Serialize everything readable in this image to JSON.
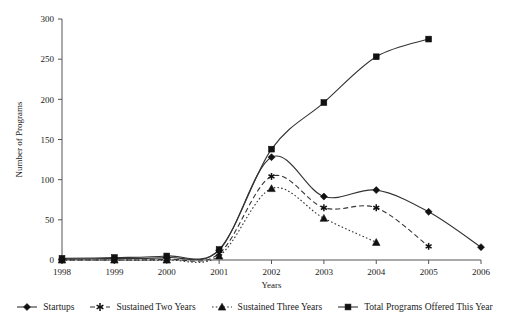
{
  "chart_data": {
    "type": "line",
    "title": "",
    "xlabel": "Years",
    "ylabel": "Number of Programs",
    "grid": false,
    "legend_position": "bottom",
    "x": [
      1998,
      1999,
      2000,
      2001,
      2002,
      2003,
      2004,
      2005,
      2006
    ],
    "categories": [
      "1998",
      "1999",
      "2000",
      "2001",
      "2002",
      "2003",
      "2004",
      "2005",
      "2006"
    ],
    "xlim": [
      1998,
      2006
    ],
    "ylim": [
      0,
      300
    ],
    "yticks": [
      0,
      50,
      100,
      150,
      200,
      250,
      300
    ],
    "ytick_labels": [
      "0",
      "50",
      "100",
      "150",
      "200",
      "250",
      "300"
    ],
    "xticks": [
      1998,
      1999,
      2000,
      2001,
      2002,
      2003,
      2004,
      2005,
      2006
    ],
    "series": [
      {
        "name": "Startups",
        "marker": "diamond",
        "linestyle": "solid",
        "color": "#333333",
        "x": [
          1998,
          1999,
          2000,
          2001,
          2002,
          2003,
          2004,
          2005,
          2006
        ],
        "values": [
          1,
          2,
          3,
          12,
          128,
          79,
          87,
          60,
          16
        ]
      },
      {
        "name": "Sustained Two Years",
        "marker": "asterisk",
        "linestyle": "dashed",
        "color": "#333333",
        "x": [
          1998,
          1999,
          2000,
          2001,
          2002,
          2003,
          2004,
          2005
        ],
        "values": [
          0,
          0,
          1,
          8,
          104,
          65,
          65,
          17
        ]
      },
      {
        "name": "Sustained Three Years",
        "marker": "triangle",
        "linestyle": "dotted",
        "color": "#333333",
        "x": [
          1998,
          1999,
          2000,
          2001,
          2002,
          2003,
          2004
        ],
        "values": [
          0,
          0,
          0,
          5,
          89,
          52,
          22
        ]
      },
      {
        "name": "Total Programs Offered This Year",
        "marker": "square",
        "linestyle": "solid",
        "color": "#333333",
        "x": [
          1998,
          1999,
          2000,
          2001,
          2002,
          2003,
          2004,
          2005
        ],
        "values": [
          2,
          3,
          5,
          13,
          138,
          196,
          253,
          275
        ]
      }
    ]
  },
  "legend": {
    "items": [
      {
        "label": "Startups",
        "marker": "diamond",
        "linestyle": "solid"
      },
      {
        "label": "Sustained Two Years",
        "marker": "asterisk",
        "linestyle": "dashed"
      },
      {
        "label": "Sustained Three Years",
        "marker": "triangle",
        "linestyle": "dotted"
      },
      {
        "label": "Total Programs Offered This Year",
        "marker": "square",
        "linestyle": "solid"
      }
    ]
  },
  "colors": {
    "axis": "#555555",
    "ink": "#1a1a1a",
    "series": "#333333",
    "background": "#ffffff"
  }
}
